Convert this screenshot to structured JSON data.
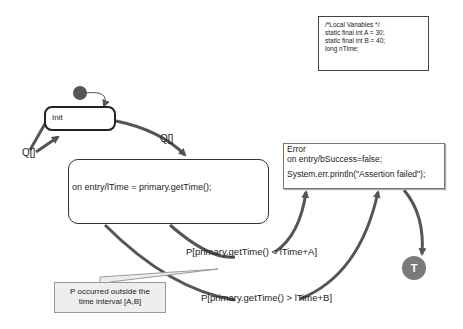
{
  "variables_box": {
    "lines": [
      "/*Local Variables */",
      "static final int A = 30;",
      "static final int B = 40;",
      "long nTime;"
    ]
  },
  "states": {
    "init": {
      "label": "Init"
    },
    "entry": {
      "label": "on entry/lTime = primary.getTime();"
    },
    "error": {
      "title": "Error",
      "entry_action": "on entry/bSuccess=false;",
      "action": "System.err.println(\"Assertion failed\");"
    },
    "terminal": {
      "label": "T"
    }
  },
  "transitions": {
    "self_loop": "Q[]",
    "init_to_entry": "Q[]",
    "lt_guard": "P[primary.getTime() < lTime+A]",
    "gt_guard": "P[primary.getTime() > lTime+B]"
  },
  "note": {
    "line1": "P occurred outside the",
    "line2": "time interval [A,B]"
  },
  "colors": {
    "edge": "#555555",
    "initial_node": "#555555",
    "terminal_node": "#7a7a7a",
    "note_bg": "#eeeeee"
  }
}
